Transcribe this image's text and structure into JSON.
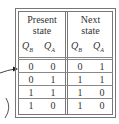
{
  "table": {
    "group_headers": [
      {
        "line1": "Present",
        "line2": "state"
      },
      {
        "line1": "Next",
        "line2": "state"
      }
    ],
    "columns": [
      {
        "var": "Q",
        "sub": "B"
      },
      {
        "var": "Q",
        "sub": "A"
      },
      {
        "var": "Q",
        "sub": "B"
      },
      {
        "var": "Q",
        "sub": "A"
      }
    ],
    "rows": [
      [
        "0",
        "0",
        "0",
        "1"
      ],
      [
        "0",
        "1",
        "1",
        "1"
      ],
      [
        "1",
        "1",
        "1",
        "0"
      ],
      [
        "1",
        "0",
        "1",
        "0"
      ]
    ]
  },
  "colors": {
    "border": "#777777",
    "text": "#333333"
  }
}
